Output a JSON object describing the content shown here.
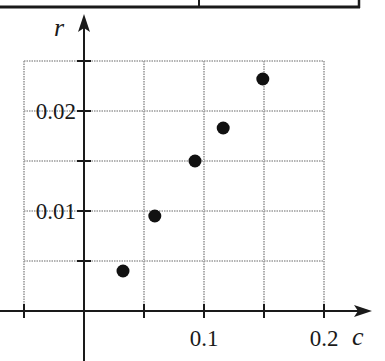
{
  "chart_data": {
    "type": "scatter",
    "title": "",
    "xlabel": "c",
    "ylabel": "r",
    "xlim": [
      -0.05,
      0.2
    ],
    "ylim": [
      0,
      0.025
    ],
    "x_gridlines": [
      -0.05,
      0,
      0.05,
      0.1,
      0.15,
      0.2
    ],
    "y_gridlines": [
      0,
      0.005,
      0.01,
      0.015,
      0.02,
      0.025
    ],
    "x_tick_labels": [
      {
        "value": 0.1,
        "label": "0.1"
      },
      {
        "value": 0.2,
        "label": "0.2"
      }
    ],
    "y_tick_labels": [
      {
        "value": 0.01,
        "label": "0.01"
      },
      {
        "value": 0.02,
        "label": "0.02"
      }
    ],
    "grid": true,
    "legend": null,
    "series": [
      {
        "name": "data",
        "color": "#111111",
        "points": [
          {
            "x": 0.0325,
            "y": 0.004
          },
          {
            "x": 0.059,
            "y": 0.0095
          },
          {
            "x": 0.0925,
            "y": 0.015
          },
          {
            "x": 0.116,
            "y": 0.0183
          },
          {
            "x": 0.149,
            "y": 0.0232
          }
        ]
      }
    ]
  },
  "colors": {
    "axis": "#1a1a1a",
    "grid": "#9a9a9a",
    "point": "#111111",
    "frame": "#1a1a1a"
  }
}
